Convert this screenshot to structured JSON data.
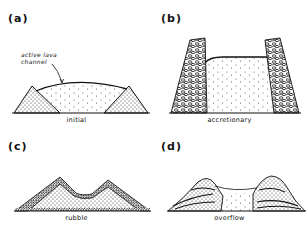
{
  "figure": {
    "panels": [
      {
        "id": "a",
        "label": "(a)",
        "caption": "initial",
        "annotation": "active lava\nchannel",
        "annotation_lines": [
          "active lava",
          "channel"
        ]
      },
      {
        "id": "b",
        "label": "(b)",
        "caption": "accretionary"
      },
      {
        "id": "c",
        "label": "(c)",
        "caption": "rubble"
      },
      {
        "id": "d",
        "label": "(d)",
        "caption": "overflow"
      }
    ],
    "colors": {
      "ink": "#111111",
      "background": "#ffffff",
      "stipple": "#333333"
    }
  }
}
